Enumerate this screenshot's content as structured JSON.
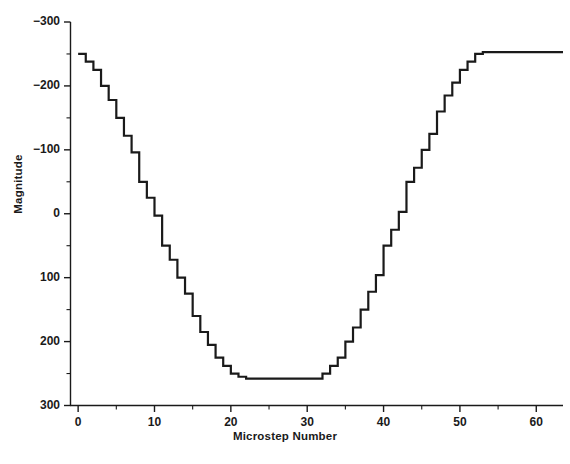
{
  "chart_data": {
    "type": "line",
    "title": "",
    "subtitle": "",
    "xlabel": "Microstep Number",
    "ylabel": "Magnitude",
    "xlim": [
      -1,
      63.5
    ],
    "ylim": [
      -300,
      300
    ],
    "xticks": [
      0,
      10,
      20,
      30,
      40,
      50,
      60
    ],
    "yticks": [
      -300,
      -200,
      -100,
      0,
      100,
      200,
      300
    ],
    "xminorticks": [
      5,
      15,
      25,
      35,
      45,
      55
    ],
    "yminorticks": [
      -250,
      -150,
      -50,
      50,
      150,
      250
    ],
    "grid": false,
    "legend": null,
    "step_style": "post",
    "line_color": "#1a1a1a",
    "line_width": 2.2,
    "annotations": [],
    "x": [
      0,
      1,
      2,
      3,
      4,
      5,
      6,
      7,
      8,
      9,
      10,
      11,
      12,
      13,
      14,
      15,
      16,
      17,
      18,
      19,
      20,
      21,
      22,
      23,
      24,
      25,
      26,
      27,
      28,
      29,
      30,
      31,
      32,
      33,
      34,
      35,
      36,
      37,
      38,
      39,
      40,
      41,
      42,
      43,
      44,
      45,
      46,
      47,
      48,
      49,
      50,
      51,
      52,
      53,
      54,
      55,
      56,
      57,
      58,
      59,
      60,
      61,
      62,
      63
    ],
    "values": [
      250,
      238,
      225,
      200,
      178,
      150,
      122,
      96,
      50,
      25,
      -3,
      -50,
      -72,
      -100,
      -125,
      -160,
      -185,
      -205,
      -225,
      -238,
      -250,
      -255,
      -258,
      -258,
      -258,
      -258,
      -258,
      -258,
      -258,
      -258,
      -258,
      -258,
      -250,
      -238,
      -225,
      -200,
      -178,
      -150,
      -122,
      -96,
      -50,
      -25,
      3,
      50,
      72,
      100,
      125,
      160,
      185,
      205,
      225,
      238,
      250,
      253,
      253,
      253,
      253,
      253,
      253,
      253,
      253,
      253,
      253,
      253
    ],
    "series": [
      {
        "name": "microstep magnitude",
        "values": [
          250,
          238,
          225,
          200,
          178,
          150,
          122,
          96,
          50,
          25,
          -3,
          -50,
          -72,
          -100,
          -125,
          -160,
          -185,
          -205,
          -225,
          -238,
          -250,
          -255,
          -258,
          -258,
          -258,
          -258,
          -258,
          -258,
          -258,
          -258,
          -258,
          -258,
          -250,
          -238,
          -225,
          -200,
          -178,
          -150,
          -122,
          -96,
          -50,
          -25,
          3,
          50,
          72,
          100,
          125,
          160,
          185,
          205,
          225,
          238,
          250,
          253,
          253,
          253,
          253,
          253,
          253,
          253,
          253,
          253,
          253,
          253
        ]
      }
    ]
  },
  "axes": {
    "y_label": "Magnitude",
    "x_label": "Microstep Number",
    "y_tick_labels": [
      "300",
      "200",
      "100",
      "0",
      "−100",
      "−200",
      "−300"
    ],
    "x_tick_labels": [
      "0",
      "10",
      "20",
      "30",
      "40",
      "50",
      "60"
    ]
  }
}
